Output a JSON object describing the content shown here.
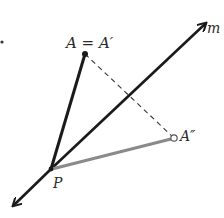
{
  "diagram": {
    "type": "geometric-reflection",
    "points": {
      "A": {
        "label": "A = A′",
        "x": 85,
        "y": 54
      },
      "P": {
        "label": "P",
        "x": 51,
        "y": 169
      },
      "A2": {
        "label": "A″",
        "x": 174,
        "y": 138
      }
    },
    "line": {
      "label": "m",
      "from": [
        14,
        205
      ],
      "to": [
        205,
        24
      ]
    },
    "segments": [
      {
        "name": "PA",
        "from": "P",
        "to": "A",
        "style": "solid-thick",
        "color": "#1a1a1a"
      },
      {
        "name": "PA2",
        "from": "P",
        "to": "A2",
        "style": "solid-thick",
        "color": "#8a8a8a"
      },
      {
        "name": "AA2",
        "from": "A",
        "to": "A2",
        "style": "dashed",
        "color": "#333333"
      }
    ],
    "colors": {
      "primary": "#1a1a1a",
      "gray": "#8a8a8a",
      "background": "#ffffff"
    }
  }
}
